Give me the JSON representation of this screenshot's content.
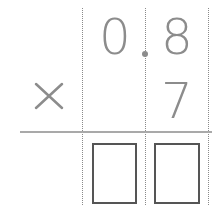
{
  "problem": {
    "multiplicand": {
      "ones": "0",
      "tenths": "8"
    },
    "multiplier": {
      "tenths": "7"
    },
    "operator": "×",
    "answer_boxes": [
      "",
      ""
    ]
  },
  "colors": {
    "digit": "#8c8c8c",
    "rule": "#a9a9a9",
    "box_border": "#555555",
    "grid_line": "#8a8a8a"
  }
}
